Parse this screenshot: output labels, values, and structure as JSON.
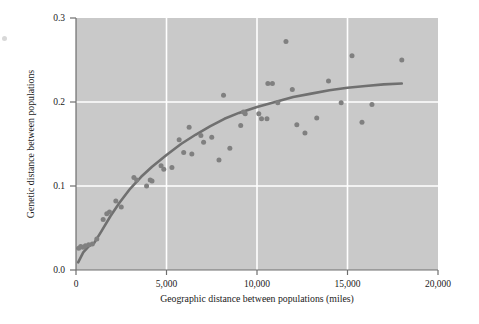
{
  "chart_data": {
    "type": "scatter",
    "title": "",
    "subtitle": "",
    "xlabel": "Geographic distance between populations (miles)",
    "ylabel": "Genetic distance between populations",
    "xlim": [
      0,
      20000
    ],
    "ylim": [
      0.0,
      0.3
    ],
    "xticks": [
      0,
      5000,
      10000,
      15000,
      20000
    ],
    "xticklabels": [
      "0",
      "5,000",
      "10,000",
      "15,000",
      "20,000"
    ],
    "yticks": [
      0.0,
      0.1,
      0.2,
      0.3
    ],
    "yticklabels": [
      "0.0",
      "0.1",
      "0.2",
      "0.3"
    ],
    "grid": "white gridlines at x = 5,000 / 10,000 / 15,000 and y = 0.1 / 0.2",
    "legend": null,
    "plot_background": "#c9c9c9",
    "point_color": "#808080",
    "line_color": "#707070",
    "marker_size_px": 5.0,
    "points": [
      {
        "x": 150,
        "y": 0.026
      },
      {
        "x": 260,
        "y": 0.028
      },
      {
        "x": 380,
        "y": 0.027
      },
      {
        "x": 520,
        "y": 0.029
      },
      {
        "x": 700,
        "y": 0.03
      },
      {
        "x": 900,
        "y": 0.031
      },
      {
        "x": 1150,
        "y": 0.037
      },
      {
        "x": 1500,
        "y": 0.06
      },
      {
        "x": 1700,
        "y": 0.067
      },
      {
        "x": 1850,
        "y": 0.069
      },
      {
        "x": 2200,
        "y": 0.082
      },
      {
        "x": 2500,
        "y": 0.075
      },
      {
        "x": 3200,
        "y": 0.11
      },
      {
        "x": 3350,
        "y": 0.107
      },
      {
        "x": 3900,
        "y": 0.1
      },
      {
        "x": 4100,
        "y": 0.107
      },
      {
        "x": 4200,
        "y": 0.106
      },
      {
        "x": 4700,
        "y": 0.124
      },
      {
        "x": 4850,
        "y": 0.12
      },
      {
        "x": 5300,
        "y": 0.122
      },
      {
        "x": 5700,
        "y": 0.155
      },
      {
        "x": 5950,
        "y": 0.14
      },
      {
        "x": 6250,
        "y": 0.17
      },
      {
        "x": 6400,
        "y": 0.138
      },
      {
        "x": 6900,
        "y": 0.16
      },
      {
        "x": 7050,
        "y": 0.152
      },
      {
        "x": 7500,
        "y": 0.158
      },
      {
        "x": 7900,
        "y": 0.131
      },
      {
        "x": 8150,
        "y": 0.208
      },
      {
        "x": 8500,
        "y": 0.145
      },
      {
        "x": 9100,
        "y": 0.172
      },
      {
        "x": 9250,
        "y": 0.188
      },
      {
        "x": 9350,
        "y": 0.186
      },
      {
        "x": 10100,
        "y": 0.186
      },
      {
        "x": 10250,
        "y": 0.18
      },
      {
        "x": 10550,
        "y": 0.18
      },
      {
        "x": 10600,
        "y": 0.222
      },
      {
        "x": 10850,
        "y": 0.222
      },
      {
        "x": 11150,
        "y": 0.199
      },
      {
        "x": 11600,
        "y": 0.272
      },
      {
        "x": 11950,
        "y": 0.215
      },
      {
        "x": 12200,
        "y": 0.173
      },
      {
        "x": 12650,
        "y": 0.163
      },
      {
        "x": 13300,
        "y": 0.181
      },
      {
        "x": 13950,
        "y": 0.225
      },
      {
        "x": 14650,
        "y": 0.199
      },
      {
        "x": 15250,
        "y": 0.255
      },
      {
        "x": 15800,
        "y": 0.176
      },
      {
        "x": 16350,
        "y": 0.197
      },
      {
        "x": 18000,
        "y": 0.25
      }
    ],
    "fit_curve": {
      "name": "fitted trend line",
      "points": [
        {
          "x": 120,
          "y": 0.009
        },
        {
          "x": 400,
          "y": 0.021
        },
        {
          "x": 700,
          "y": 0.028
        },
        {
          "x": 1000,
          "y": 0.032
        },
        {
          "x": 1400,
          "y": 0.046
        },
        {
          "x": 1900,
          "y": 0.064
        },
        {
          "x": 2400,
          "y": 0.08
        },
        {
          "x": 3000,
          "y": 0.097
        },
        {
          "x": 3600,
          "y": 0.111
        },
        {
          "x": 4200,
          "y": 0.123
        },
        {
          "x": 5000,
          "y": 0.137
        },
        {
          "x": 5800,
          "y": 0.15
        },
        {
          "x": 6600,
          "y": 0.161
        },
        {
          "x": 7400,
          "y": 0.171
        },
        {
          "x": 8200,
          "y": 0.18
        },
        {
          "x": 9000,
          "y": 0.187
        },
        {
          "x": 10000,
          "y": 0.194
        },
        {
          "x": 11000,
          "y": 0.2
        },
        {
          "x": 12000,
          "y": 0.206
        },
        {
          "x": 13000,
          "y": 0.21
        },
        {
          "x": 14000,
          "y": 0.214
        },
        {
          "x": 15000,
          "y": 0.217
        },
        {
          "x": 16000,
          "y": 0.219
        },
        {
          "x": 17000,
          "y": 0.221
        },
        {
          "x": 18000,
          "y": 0.222
        }
      ]
    }
  }
}
